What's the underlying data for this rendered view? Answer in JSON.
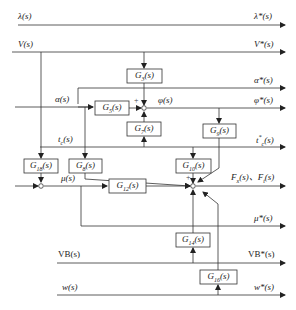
{
  "diagram": {
    "inputs": {
      "lambda": "λ(s)",
      "V": "V(s)",
      "alpha": "α(s)",
      "t_c": "t",
      "t_c_sub": "c",
      "t_c_tail": "(s)",
      "VB": "VB(s)",
      "w": "w(s)"
    },
    "internal": {
      "phi": "φ(s)",
      "mu": "μ(s)"
    },
    "outputs": {
      "lambda_star": "λ*(s)",
      "V_star": "V*(s)",
      "alpha_star": "α*(s)",
      "phi_star": "φ*(s)",
      "t_c_star": "t",
      "t_c_star_sup": "*",
      "t_c_star_sub": "c",
      "t_c_star_tail": "(s)",
      "F_star": "F",
      "F_x_sub": "x",
      "F_sep": "(s)、F",
      "F_t_sub": "t",
      "F_tail": "(s)",
      "mu_star": "μ*(s)",
      "VB_star": "VB*(s)",
      "w_star": "w*(s)"
    },
    "blocks": [
      {
        "id": "G3",
        "label": "G",
        "sub": "3"
      },
      {
        "id": "G5",
        "label": "G",
        "sub": "5"
      },
      {
        "id": "G7",
        "label": "G",
        "sub": "7"
      },
      {
        "id": "G8",
        "label": "G",
        "sub": "8"
      },
      {
        "id": "G9",
        "label": "G",
        "sub": "9"
      },
      {
        "id": "G10",
        "label": "G",
        "sub": "10"
      },
      {
        "id": "G12",
        "label": "G",
        "sub": "12"
      },
      {
        "id": "G14",
        "label": "G",
        "sub": "14"
      },
      {
        "id": "G16",
        "label": "G",
        "sub": "16"
      },
      {
        "id": "G18",
        "label": "G",
        "sub": "18"
      }
    ],
    "block_tail": "(s)",
    "signs": {
      "plus": "+"
    }
  }
}
